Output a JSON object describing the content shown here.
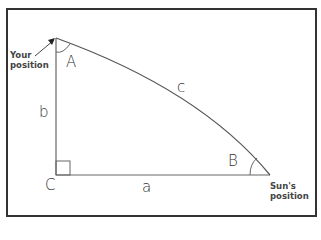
{
  "diagram": {
    "vertices": [
      {
        "name": "A",
        "label": "A"
      },
      {
        "name": "B",
        "label": "B"
      },
      {
        "name": "C",
        "label": "C"
      }
    ],
    "sides": {
      "a": "a",
      "b": "b",
      "c": "c"
    },
    "annotations": {
      "your_position_line1": "Your",
      "your_position_line2": "position",
      "sun_position_line1": "Sun's",
      "sun_position_line2": "position"
    },
    "colors": {
      "line": "#555555",
      "border": "#333333",
      "text": "#333333"
    }
  }
}
